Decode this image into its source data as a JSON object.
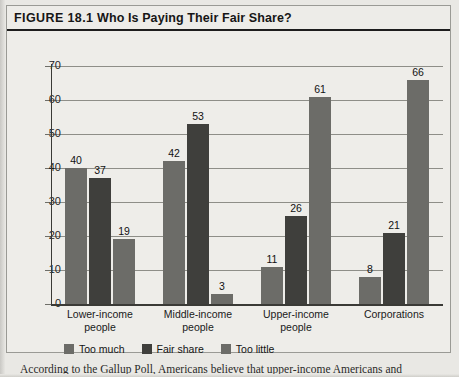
{
  "figure": {
    "number_label": "FIGURE 18.1",
    "title": "Who Is Paying Their Fair Share?",
    "caption": "According to the Gallup Poll, Americans believe that upper-income Americans and"
  },
  "legend": {
    "items": [
      {
        "label": "Too much",
        "color": "#6c6c68"
      },
      {
        "label": "Fair share",
        "color": "#3f3f3c"
      },
      {
        "label": "Too little",
        "color": "#6c6c68"
      }
    ]
  },
  "chart_data": {
    "type": "bar",
    "title": "Who Is Paying Their Fair Share?",
    "xlabel": "",
    "ylabel": "",
    "ylim": [
      0,
      70
    ],
    "yticks": [
      0,
      10,
      20,
      30,
      40,
      50,
      60,
      70
    ],
    "grid": true,
    "legend_position": "bottom-left",
    "categories": [
      "Lower-income people",
      "Middle-income people",
      "Upper-income people",
      "Corporations"
    ],
    "category_lines": [
      [
        "Lower-income",
        "people"
      ],
      [
        "Middle-income",
        "people"
      ],
      [
        "Upper-income",
        "people"
      ],
      [
        "Corporations",
        ""
      ]
    ],
    "series": [
      {
        "name": "Too much",
        "color": "#6c6c68",
        "values": [
          40,
          42,
          11,
          8
        ]
      },
      {
        "name": "Fair share",
        "color": "#3f3f3c",
        "values": [
          37,
          53,
          26,
          21
        ]
      },
      {
        "name": "Too little",
        "color": "#6c6c68",
        "values": [
          19,
          3,
          61,
          66
        ]
      }
    ]
  }
}
